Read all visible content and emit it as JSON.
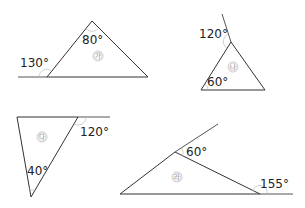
{
  "figures": [
    {
      "id": "ga",
      "label": "㉮",
      "vertices": [
        [
          92,
          21
        ],
        [
          47,
          77
        ],
        [
          148,
          77
        ]
      ],
      "extension": [
        [
          18,
          77
        ],
        [
          47,
          77
        ]
      ],
      "angles": [
        {
          "text": "80°",
          "x": 82,
          "y": 44
        },
        {
          "text": "130°",
          "x": 27,
          "y": 67
        }
      ],
      "label_pos": [
        95,
        59
      ]
    },
    {
      "id": "na",
      "label": "㉯",
      "vertices": [
        [
          231,
          42
        ],
        [
          201,
          90
        ],
        [
          265,
          90
        ]
      ],
      "extension": [
        [
          231,
          42
        ],
        [
          222,
          14
        ]
      ],
      "angles": [
        {
          "text": "120°",
          "x": 199,
          "y": 38
        },
        {
          "text": "60°",
          "x": 207,
          "y": 86
        }
      ],
      "label_pos": [
        239,
        68
      ]
    },
    {
      "id": "da",
      "label": "㉰",
      "vertices": [
        [
          17,
          117
        ],
        [
          78,
          117
        ],
        [
          31,
          197
        ]
      ],
      "extension": [
        [
          78,
          117
        ],
        [
          110,
          117
        ]
      ],
      "angles": [
        {
          "text": "120°",
          "x": 80,
          "y": 136
        },
        {
          "text": "40°",
          "x": 27,
          "y": 175
        }
      ],
      "label_pos": [
        42,
        138
      ]
    },
    {
      "id": "ra",
      "label": "㉱",
      "vertices": [
        [
          120,
          194
        ],
        [
          175,
          152
        ],
        [
          260,
          194
        ]
      ],
      "extensions": [
        [
          [
            175,
            152
          ],
          [
            218,
            124
          ]
        ],
        [
          [
            260,
            194
          ],
          [
            293,
            194
          ]
        ]
      ],
      "angles": [
        {
          "text": "60°",
          "x": 186,
          "y": 156
        },
        {
          "text": "155°",
          "x": 260,
          "y": 188
        }
      ],
      "label_pos": [
        177,
        180
      ]
    }
  ],
  "text": {
    "ga_label": "㉮",
    "na_label": "㉯",
    "da_label": "㉰",
    "ra_label": "㉱",
    "ga_angle_top": "80°",
    "ga_angle_ext": "130°",
    "na_angle_ext": "120°",
    "na_angle_left": "60°",
    "da_angle_ext": "120°",
    "da_angle_bottom": "40°",
    "ra_angle_top": "60°",
    "ra_angle_ext": "155°"
  },
  "colors": {
    "line": "#333333",
    "text": "#222222",
    "label": "#9a9a9a",
    "arc": "#bdbdbd",
    "background": "#ffffff"
  }
}
